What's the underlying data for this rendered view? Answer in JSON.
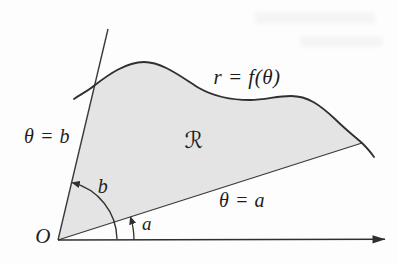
{
  "figure": {
    "type": "polar-region-diagram",
    "labels": {
      "curve_equation": "r = f(θ)",
      "region_name": "ℛ",
      "upper_ray": "θ = b",
      "lower_ray": "θ = a",
      "upper_angle": "b",
      "lower_angle": "a",
      "origin": "O"
    },
    "colors": {
      "background": "#fdfdfd",
      "region_fill": "#e4e4e4",
      "line": "#3a3a3a",
      "curve": "#2f2f2f",
      "text": "#1d1d1d"
    }
  }
}
